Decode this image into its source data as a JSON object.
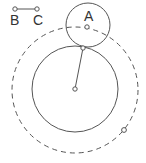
{
  "diagram": {
    "stroke_color": "#555555",
    "point_fill": "#ffffff",
    "segment": {
      "label_b": "B",
      "label_c": "C",
      "b": {
        "x": 15,
        "y": 9
      },
      "c": {
        "x": 37,
        "y": 9
      }
    },
    "small_circle": {
      "label": "A",
      "cx": 88,
      "cy": 25,
      "r": 22
    },
    "point_a": {
      "x": 87,
      "y": 27
    },
    "big_circle": {
      "cx": 75,
      "cy": 89,
      "r": 43
    },
    "intersection_point": {
      "x": 83,
      "y": 48
    },
    "center_point": {
      "x": 75,
      "y": 89
    },
    "dashed_circle": {
      "cx": 75,
      "cy": 90,
      "r": 63
    },
    "dashed_point": {
      "x": 124,
      "y": 130
    }
  }
}
